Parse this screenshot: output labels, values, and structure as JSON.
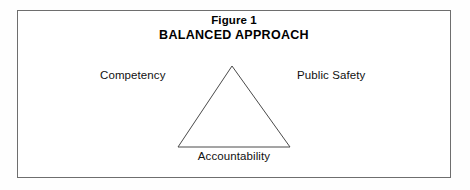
{
  "figure": {
    "title_line_1": "Figure 1",
    "title_line_2": "BALANCED APPROACH",
    "border_color": "#6e6e6e",
    "background_color": "#ffffff",
    "text_color": "#000000"
  },
  "diagram": {
    "shape": "triangle",
    "stroke_color": "#4a4a4a",
    "fill": "none",
    "vertices": {
      "apex": {
        "x": 232,
        "y": 66
      },
      "bottom_left": {
        "x": 178,
        "y": 147
      },
      "bottom_right": {
        "x": 290,
        "y": 147
      }
    },
    "labels": {
      "left": "Competency",
      "right": "Public Safety",
      "bottom": "Accountability"
    }
  }
}
